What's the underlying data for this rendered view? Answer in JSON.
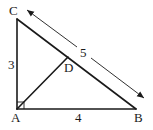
{
  "diagram": {
    "type": "right-triangle",
    "points": {
      "A": {
        "label": "A",
        "x": 17,
        "y": 109
      },
      "B": {
        "label": "B",
        "x": 136,
        "y": 109
      },
      "C": {
        "label": "C",
        "x": 17,
        "y": 19
      },
      "D": {
        "label": "D",
        "x": 68,
        "y": 57
      }
    },
    "segments": [
      {
        "from": "A",
        "to": "C",
        "length_label": "3"
      },
      {
        "from": "A",
        "to": "B",
        "length_label": "4"
      },
      {
        "from": "C",
        "to": "B",
        "length_label": "5"
      },
      {
        "from": "A",
        "to": "D",
        "length_label": ""
      }
    ],
    "right_angle_at": "A",
    "dimension_arrow": {
      "label": "5",
      "parallel_to": "CB"
    },
    "labels": {
      "A": "A",
      "B": "B",
      "C": "C",
      "D": "D",
      "side_AC": "3",
      "side_AB": "4",
      "side_CB": "5"
    }
  }
}
